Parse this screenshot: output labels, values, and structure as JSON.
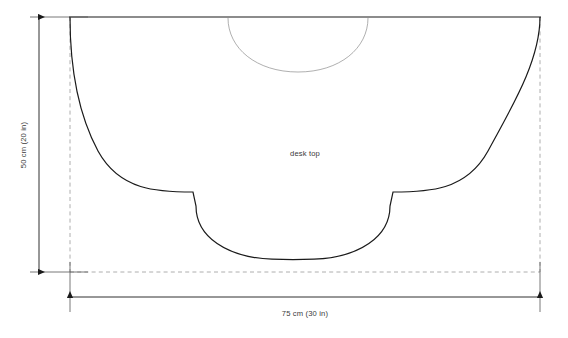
{
  "drawing": {
    "title": "desk top pattern drawing",
    "part_label": "desk top",
    "dimensions": {
      "height_label": "50 cm (20 in)",
      "width_label": "75 cm (30 in)"
    },
    "colors": {
      "outline": "#1a1a1a",
      "construction_arc": "#8c8c8c",
      "dashed_box": "#9a9a9a",
      "dimension_line": "#1a1a1a",
      "text": "#3a3a3a",
      "background": "#ffffff"
    },
    "geometry": {
      "top_edge": {
        "x1": 70,
        "y1": 17,
        "x2": 540,
        "y2": 17
      },
      "bounding_box": {
        "left": 70,
        "top": 17,
        "right": 540,
        "bottom": 272
      },
      "outline_path": "M 70 17 C 70 60, 74 108, 96 150 C 118 192, 158 192, 193 192 L 196 205 C 196 236, 226 257, 272 259 C 286 259.6, 300 259.6, 314 259 C 360 257, 390 236, 390 205 L 393 192 C 428 192, 468 192, 490 150 C 512 108, 540 60, 540 17",
      "construction_arc_path": "M 228 18 C 228 48, 256 72, 298 72 C 340 72, 368 48, 368 18",
      "notch_left": {
        "x": 193,
        "y": 192
      },
      "notch_right": {
        "x": 393,
        "y": 192
      }
    }
  }
}
